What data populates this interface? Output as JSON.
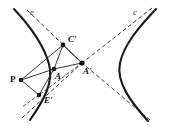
{
  "figure": {
    "width": 169,
    "height": 133,
    "background": "#ffffff",
    "stroke_color": "#1a1a1a",
    "dash_color": "#3a3a3a"
  },
  "curve_labels": {
    "left": "e",
    "right": "c"
  },
  "points": [
    {
      "id": "P",
      "label": "P",
      "x": 21,
      "y": 80,
      "dot": true
    },
    {
      "id": "A",
      "label": "A",
      "x": 54,
      "y": 69,
      "dot": true
    },
    {
      "id": "Ap",
      "label": "A'",
      "x": 82,
      "y": 63,
      "dot": true
    },
    {
      "id": "Cp",
      "label": "C'",
      "x": 63,
      "y": 45,
      "dot": true
    },
    {
      "id": "Ep",
      "label": "E'",
      "x": 39,
      "y": 95,
      "dot": true
    }
  ],
  "point_label_offsets": {
    "P": {
      "dx": -11,
      "dy": -5
    },
    "A": {
      "dx": 1,
      "dy": 3
    },
    "Ap": {
      "dx": 1,
      "dy": 4
    },
    "Cp": {
      "dx": 5,
      "dy": -10
    },
    "Ep": {
      "dx": 5,
      "dy": 1
    }
  },
  "solid_segments": [
    {
      "name": "P-to-Cprime",
      "from": "P",
      "to": "Cp"
    },
    {
      "name": "P-to-A",
      "from": "P",
      "to": "A"
    },
    {
      "name": "P-to-Eprime",
      "from": "P",
      "to": "Ep"
    },
    {
      "name": "Cprime-to-A",
      "from": "Cp",
      "to": "A"
    },
    {
      "name": "Cprime-to-Aprime",
      "from": "Cp",
      "to": "Ap"
    },
    {
      "name": "A-to-Aprime",
      "from": "A",
      "to": "Ap"
    },
    {
      "name": "A-to-Eprime",
      "from": "A",
      "to": "Ep"
    }
  ],
  "dashed_rays": [
    {
      "name": "ray-Aprime-upper-left",
      "x1": 82,
      "y1": 63,
      "x2": 27,
      "y2": 10
    },
    {
      "name": "ray-Aprime-upper-right",
      "x1": 82,
      "y1": 63,
      "x2": 152,
      "y2": 8
    },
    {
      "name": "ray-Aprime-lower-left",
      "x1": 82,
      "y1": 63,
      "x2": 22,
      "y2": 118
    },
    {
      "name": "ray-Aprime-lower-right",
      "x1": 82,
      "y1": 63,
      "x2": 150,
      "y2": 120
    },
    {
      "name": "ray-Aprime-to-Eprime",
      "x1": 82,
      "y1": 63,
      "x2": 39,
      "y2": 95
    },
    {
      "name": "ray-Aprime-to-Cprime",
      "x1": 82,
      "y1": 63,
      "x2": 63,
      "y2": 45
    }
  ],
  "branches": {
    "left_path": "M 14,9 C 30,26 44,46 49,64 C 54,82 44,100 30,120",
    "right_path": "M 156,9 C 140,26 124,44 120,63 C 116,82 130,101 148,121"
  },
  "curve_label_positions": {
    "left": {
      "x": 30,
      "y": 8
    },
    "right": {
      "x": 133,
      "y": 8
    }
  }
}
